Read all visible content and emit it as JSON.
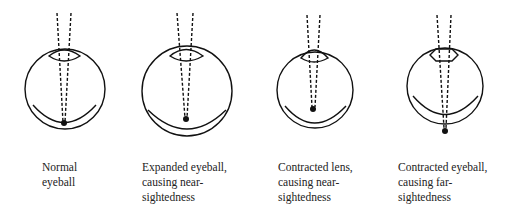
{
  "figure": {
    "panels": [
      {
        "id": "normal",
        "caption": "Normal\neyeball"
      },
      {
        "id": "expanded",
        "caption": "Expanded eyeball,\ncausing near-\nsightedness"
      },
      {
        "id": "contracted-lens",
        "caption": "Contracted lens,\ncausing near-\nsightedness"
      },
      {
        "id": "contracted-eyeball",
        "caption": "Contracted eyeball,\ncausing far-\nsightedness"
      }
    ],
    "colors": {
      "stroke": "#111111",
      "text": "#222222",
      "background": "#ffffff"
    }
  }
}
